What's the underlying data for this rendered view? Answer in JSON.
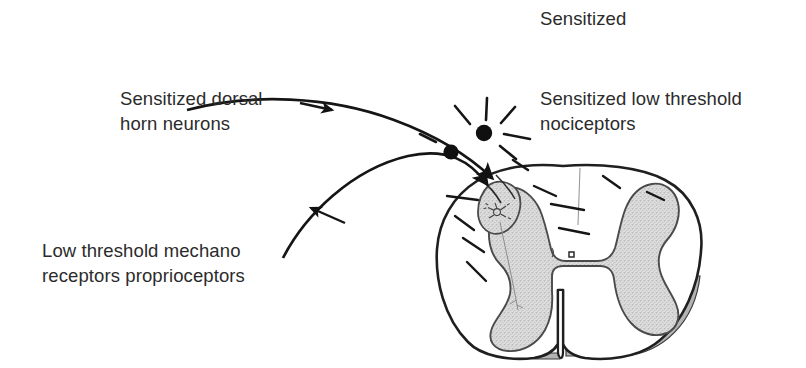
{
  "figure": {
    "title": "Sensitized",
    "background_color": "#ffffff",
    "ink_color": "#1a1a1a",
    "text_color": "#2b2b2b",
    "gray_matter_color": "#d9d9d9",
    "pia_mater_color": "#b0aeae"
  },
  "labels": {
    "dorsal_horn": {
      "line1": "Sensitized dorsal",
      "line2": "horn neurons"
    },
    "nociceptors": {
      "line1": "Sensitized low threshold",
      "line2": "nociceptors"
    },
    "mechano": {
      "line1": "Low threshold mechano",
      "line2": "receptors proprioceptors"
    }
  },
  "anatomy": {
    "cord_outline": "spinal-cord-white-matter",
    "gray_matter": "butterfly-gray-matter",
    "central_canal": "central-canal",
    "ventral_fissure": "ventral-median-fissure",
    "dorsal_septum": "dorsal-median-septum",
    "dorsal_root_entry": "dorsal-root-entry-zone",
    "dorsal_horn_neuron": "dorsal-horn-neuron-sketch",
    "pia_mater": "pia-mater-band"
  },
  "afferents": {
    "upper_fiber": "sensitized-nociceptor-afferent",
    "lower_fiber": "low-threshold-mechanoreceptor-afferent",
    "cell_bodies": 2,
    "burst_lines": 7,
    "tract_dashes": 9
  }
}
